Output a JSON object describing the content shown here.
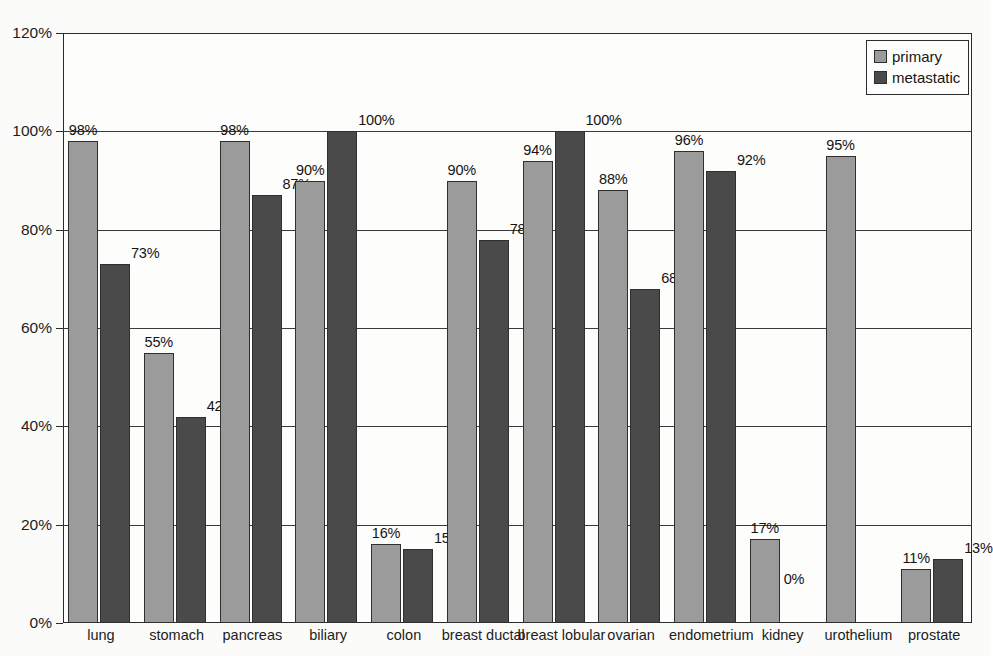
{
  "figure": {
    "caption_remnant": "",
    "background_color": "#fbfbfa"
  },
  "legend": {
    "position": "top-right",
    "entries": [
      {
        "label": "primary",
        "color": "#9a9b9a",
        "swatch": "primary-swatch"
      },
      {
        "label": "metastatic",
        "color": "#4a4a4a",
        "swatch": "metastatic-swatch"
      }
    ]
  },
  "axes": {
    "y_ticks": [
      "0%",
      "20%",
      "40%",
      "60%",
      "80%",
      "100%",
      "120%"
    ],
    "x_categories": [
      "lung",
      "stomach",
      "pancreas",
      "biliary",
      "colon",
      "breast ductal",
      "breast lobular",
      "ovarian",
      "endometrium",
      "kidney",
      "urothelium",
      "prostate"
    ]
  },
  "chart_data": {
    "type": "bar",
    "title": "",
    "subtitle": "",
    "xlabel": "",
    "ylabel": "",
    "ylim": [
      0,
      120
    ],
    "ytick_step": 20,
    "ytick_format": "percent",
    "grid": true,
    "legend_position": "top-right",
    "categories": [
      "lung",
      "stomach",
      "pancreas",
      "biliary",
      "colon",
      "breast ductal",
      "breast lobular",
      "ovarian",
      "endometrium",
      "kidney",
      "urothelium",
      "prostate"
    ],
    "series": [
      {
        "name": "primary",
        "color": "#9a9b9a",
        "values": [
          98,
          55,
          98,
          90,
          16,
          90,
          94,
          88,
          96,
          17,
          95,
          11
        ],
        "labels": [
          "98%",
          "55%",
          "98%",
          "90%",
          "16%",
          "90%",
          "94%",
          "88%",
          "96%",
          "17%",
          "95%",
          "11%"
        ]
      },
      {
        "name": "metastatic",
        "color": "#4a4a4a",
        "values": [
          73,
          42,
          87,
          100,
          15,
          78,
          100,
          68,
          92,
          0,
          null,
          13
        ],
        "labels": [
          "73%",
          "42%",
          "87%",
          "100%",
          "15%",
          "78%",
          "100%",
          "68%",
          "92%",
          "0%",
          "",
          "13%"
        ]
      }
    ]
  }
}
